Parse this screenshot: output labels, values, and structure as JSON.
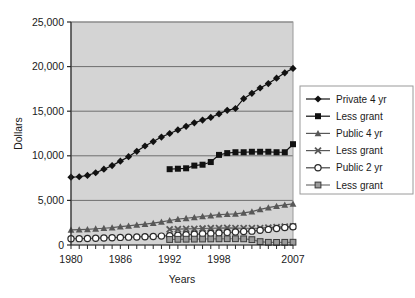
{
  "chart_data": {
    "type": "line",
    "title": "",
    "xlabel": "Years",
    "ylabel": "Dollars",
    "xlim": [
      1980,
      2007
    ],
    "ylim": [
      0,
      25000
    ],
    "ytick_labels": [
      "0",
      "5,000",
      "10,000",
      "15,000",
      "20,000",
      "25,000"
    ],
    "ytick_values": [
      0,
      5000,
      10000,
      15000,
      20000,
      25000
    ],
    "xtick_labels": [
      "1980",
      "1986",
      "1992",
      "1998",
      "2007"
    ],
    "xtick_values": [
      1980,
      1986,
      1992,
      1998,
      2007
    ],
    "grid": true,
    "grid_axis": "y",
    "plot_background": "#d4d4d4",
    "legend_position": "right",
    "x": [
      1980,
      1981,
      1982,
      1983,
      1984,
      1985,
      1986,
      1987,
      1988,
      1989,
      1990,
      1991,
      1992,
      1993,
      1994,
      1995,
      1996,
      1997,
      1998,
      1999,
      2000,
      2001,
      2002,
      2003,
      2004,
      2005,
      2006,
      2007
    ],
    "series": [
      {
        "name": "Private 4 yr",
        "marker": "diamond",
        "color": "#111111",
        "x": [
          1980,
          1981,
          1982,
          1983,
          1984,
          1985,
          1986,
          1987,
          1988,
          1989,
          1990,
          1991,
          1992,
          1993,
          1994,
          1995,
          1996,
          1997,
          1998,
          1999,
          2000,
          2001,
          2002,
          2003,
          2004,
          2005,
          2006,
          2007
        ],
        "values": [
          7600,
          7650,
          7800,
          8100,
          8500,
          8900,
          9400,
          9900,
          10500,
          11100,
          11600,
          12100,
          12500,
          12900,
          13300,
          13700,
          14000,
          14300,
          14700,
          15100,
          15300,
          16400,
          17000,
          17600,
          18100,
          18700,
          19300,
          19800
        ]
      },
      {
        "name": "Less grant",
        "marker": "square",
        "color": "#111111",
        "x": [
          1992,
          1993,
          1994,
          1995,
          1996,
          1997,
          1998,
          1999,
          2000,
          2001,
          2002,
          2003,
          2004,
          2005,
          2006,
          2007
        ],
        "values": [
          8500,
          8550,
          8600,
          8900,
          9000,
          9300,
          10100,
          10300,
          10400,
          10400,
          10450,
          10450,
          10450,
          10400,
          10400,
          11300
        ]
      },
      {
        "name": "Public 4 yr",
        "marker": "triangle",
        "color": "#585858",
        "x": [
          1980,
          1981,
          1982,
          1983,
          1984,
          1985,
          1986,
          1987,
          1988,
          1989,
          1990,
          1991,
          1992,
          1993,
          1994,
          1995,
          1996,
          1997,
          1998,
          1999,
          2000,
          2001,
          2002,
          2003,
          2004,
          2005,
          2006,
          2007
        ],
        "values": [
          1700,
          1720,
          1760,
          1820,
          1880,
          1950,
          2050,
          2150,
          2250,
          2350,
          2450,
          2600,
          2750,
          2900,
          3000,
          3100,
          3200,
          3300,
          3400,
          3450,
          3500,
          3600,
          3750,
          4000,
          4200,
          4350,
          4500,
          4600
        ]
      },
      {
        "name": "Less grant",
        "marker": "x",
        "color": "#585858",
        "x": [
          1992,
          1993,
          1994,
          1995,
          1996,
          1997,
          1998,
          1999,
          2000,
          2001,
          2002,
          2003,
          2004,
          2005,
          2006,
          2007
        ],
        "values": [
          1750,
          1780,
          1800,
          1820,
          1850,
          1880,
          1900,
          1920,
          1900,
          1880,
          1880,
          1900,
          1950,
          2000,
          2050,
          2100
        ]
      },
      {
        "name": "Public 2 yr",
        "marker": "circle-open",
        "color": "#444444",
        "x": [
          1980,
          1981,
          1982,
          1983,
          1984,
          1985,
          1986,
          1987,
          1988,
          1989,
          1990,
          1991,
          1992,
          1993,
          1994,
          1995,
          1996,
          1997,
          1998,
          1999,
          2000,
          2001,
          2002,
          2003,
          2004,
          2005,
          2006,
          2007
        ],
        "values": [
          700,
          710,
          730,
          760,
          790,
          820,
          850,
          880,
          900,
          930,
          960,
          1000,
          1050,
          1100,
          1150,
          1200,
          1250,
          1300,
          1350,
          1400,
          1450,
          1500,
          1550,
          1650,
          1750,
          1850,
          1950,
          2050
        ]
      },
      {
        "name": "Less grant",
        "marker": "square-shaded",
        "color": "#707070",
        "x": [
          1992,
          1993,
          1994,
          1995,
          1996,
          1997,
          1998,
          1999,
          2000,
          2001,
          2002,
          2003,
          2004,
          2005,
          2006,
          2007
        ],
        "values": [
          620,
          640,
          650,
          660,
          670,
          680,
          690,
          700,
          700,
          690,
          600,
          380,
          300,
          290,
          300,
          310
        ]
      }
    ]
  },
  "legend": {
    "items": [
      {
        "label": "Private 4 yr",
        "marker": "diamond"
      },
      {
        "label": "Less grant",
        "marker": "square"
      },
      {
        "label": "Public 4 yr",
        "marker": "triangle"
      },
      {
        "label": "Less grant",
        "marker": "x"
      },
      {
        "label": "Public 2 yr",
        "marker": "circle-open"
      },
      {
        "label": "Less grant",
        "marker": "square-shaded"
      }
    ]
  }
}
